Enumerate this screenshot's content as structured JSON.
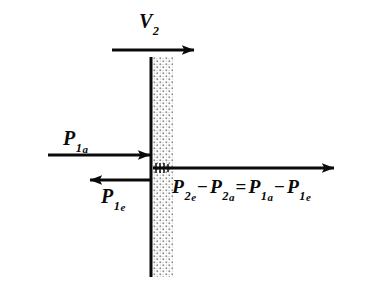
{
  "figure": {
    "background_color": "#ffffff",
    "ink_color": "#0a0a0a",
    "stipple_color": "#8d8d8d"
  },
  "barrier": {
    "name": "wall",
    "line_x": 151,
    "line_top": 57,
    "line_bottom": 277,
    "band_x": 153,
    "band_width": 20,
    "fill_pattern": "stipple-dots"
  },
  "arrows": {
    "velocity": {
      "label_base": "V",
      "label_sub": "2",
      "direction": "right",
      "x1": 112,
      "y1": 50,
      "x2": 196,
      "y2": 50
    },
    "incident_momentum": {
      "label_base": "P",
      "label_sub": "1",
      "label_sub2": "a",
      "direction": "right",
      "x1": 48,
      "y1": 155,
      "x2": 152,
      "y2": 155
    },
    "reflected_momentum": {
      "label_base": "P",
      "label_sub": "1",
      "label_sub2": "e",
      "direction": "left",
      "x1": 152,
      "y1": 180,
      "x2": 88,
      "y2": 180
    },
    "transferred_momentum": {
      "direction": "right",
      "x1": 154,
      "y1": 168,
      "x2": 336,
      "y2": 168,
      "tick_marks": 4
    }
  },
  "equation": {
    "terms": [
      {
        "base": "P",
        "sub": "2",
        "sub2": "e"
      },
      {
        "operator": "−"
      },
      {
        "base": "P",
        "sub": "2",
        "sub2": "a"
      },
      {
        "operator": "="
      },
      {
        "base": "P",
        "sub": "1",
        "sub2": "a"
      },
      {
        "operator": "−"
      },
      {
        "base": "P",
        "sub": "1",
        "sub2": "e"
      }
    ],
    "p2e_base": "P",
    "p2e_sub": "2",
    "p2e_sub2": "e",
    "minus1": "−",
    "p2a_base": "P",
    "p2a_sub": "2",
    "p2a_sub2": "a",
    "equals": "=",
    "p1a_base": "P",
    "p1a_sub": "1",
    "p1a_sub2": "a",
    "minus2": "−",
    "p1e_base": "P",
    "p1e_sub": "1",
    "p1e_sub2": "e"
  },
  "labels": {
    "v2_base": "V",
    "v2_sub": "2",
    "p1a_base": "P",
    "p1a_sub": "1",
    "p1a_sub2": "a",
    "p1e_base": "P",
    "p1e_sub": "1",
    "p1e_sub2": "e"
  }
}
